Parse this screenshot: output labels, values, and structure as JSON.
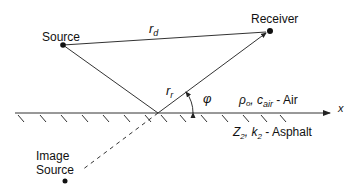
{
  "diagram": {
    "labels": {
      "source": "Source",
      "receiver": "Receiver",
      "image_source_line1": "Image",
      "image_source_line2": "Source",
      "direct_path": "r",
      "direct_path_sub": "d",
      "reflected_path": "r",
      "reflected_path_sub": "r",
      "angle": "φ",
      "x_axis": "x",
      "air_rho": "ρ",
      "air_rho_sub": "o",
      "air_c": ", c",
      "air_c_sub": "air",
      "air_medium": " - Air",
      "ground_Z": "Z",
      "ground_Z_sub": "2",
      "ground_k": ", k",
      "ground_k_sub": "2",
      "ground_medium": " - Asphalt"
    },
    "colors": {
      "line": "#333333",
      "text": "#111111",
      "background": "#ffffff"
    }
  }
}
